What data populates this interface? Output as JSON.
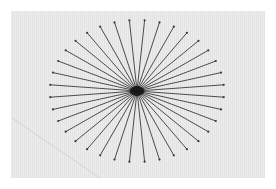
{
  "scene": {
    "description": "Photo of a printed starburst pattern on gray textured paper",
    "background_color": "#ffffff",
    "paper_color": "#e8e8e8",
    "line_color": "#3a3a3a",
    "starburst": {
      "center": [
        137,
        91
      ],
      "radius_x": 87,
      "radius_y": 71,
      "line_count": 36,
      "angle_offset_deg": 5
    },
    "crease": {
      "from": [
        12,
        118
      ],
      "to": [
        100,
        178
      ]
    }
  }
}
